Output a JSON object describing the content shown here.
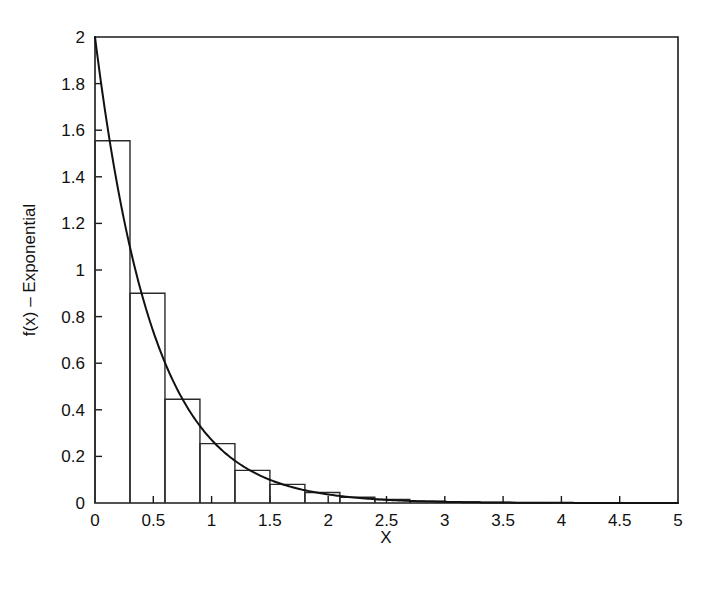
{
  "chart_data": {
    "type": "bar",
    "title": "",
    "xlabel": "X",
    "ylabel": "f(x) – Exponential",
    "xlim": [
      0,
      5
    ],
    "ylim": [
      0,
      2
    ],
    "grid": false,
    "legend": null,
    "x_ticks": [
      "0",
      "0.5",
      "1",
      "1.5",
      "2",
      "2.5",
      "3",
      "3.5",
      "4",
      "4.5",
      "5"
    ],
    "x_tick_values": [
      0,
      0.5,
      1,
      1.5,
      2,
      2.5,
      3,
      3.5,
      4,
      4.5,
      5
    ],
    "y_ticks": [
      "0",
      "0.2",
      "0.4",
      "0.6",
      "0.8",
      "1",
      "1.2",
      "1.4",
      "1.6",
      "1.8",
      "2"
    ],
    "y_tick_values": [
      0,
      0.2,
      0.4,
      0.6,
      0.8,
      1.0,
      1.2,
      1.4,
      1.6,
      1.8,
      2.0
    ],
    "bin_width": 0.3,
    "bin_edges": [
      0,
      0.3,
      0.6,
      0.9,
      1.2,
      1.5,
      1.8,
      2.1,
      2.4,
      2.7,
      3.0,
      3.3,
      3.6,
      3.9,
      4.2,
      4.5,
      4.8
    ],
    "categories": [
      "0-0.3",
      "0.3-0.6",
      "0.6-0.9",
      "0.9-1.2",
      "1.2-1.5",
      "1.5-1.8",
      "1.8-2.1",
      "2.1-2.4",
      "2.4-2.7",
      "2.7-3.0",
      "3.0-3.3",
      "3.3-3.6",
      "3.6-3.9",
      "3.9-4.2",
      "4.2-4.5",
      "4.5-4.8"
    ],
    "values": [
      1.555,
      0.9,
      0.445,
      0.255,
      0.14,
      0.08,
      0.045,
      0.025,
      0.015,
      0.008,
      0.004,
      0.002,
      0.001,
      0.0,
      0.0,
      0.0
    ],
    "series": [
      {
        "name": "Histogram (empirical density)",
        "type": "bar",
        "values": [
          1.555,
          0.9,
          0.445,
          0.255,
          0.14,
          0.08,
          0.045,
          0.025,
          0.015,
          0.008,
          0.004,
          0.002,
          0.001,
          0.0,
          0.0,
          0.0
        ]
      },
      {
        "name": "Exponential PDF (rate = 2)",
        "type": "line",
        "rate": 2,
        "x": [
          0,
          0.1,
          0.2,
          0.3,
          0.4,
          0.5,
          0.6,
          0.7,
          0.8,
          0.9,
          1.0,
          1.2,
          1.4,
          1.6,
          1.8,
          2.0,
          2.25,
          2.5,
          2.75,
          3.0,
          3.5,
          4.0,
          4.5,
          5.0
        ],
        "values": [
          2.0,
          1.637,
          1.341,
          1.098,
          0.899,
          0.736,
          0.602,
          0.493,
          0.404,
          0.331,
          0.271,
          0.181,
          0.122,
          0.0815,
          0.0546,
          0.0366,
          0.0222,
          0.0135,
          0.00818,
          0.00496,
          0.00182,
          0.00067,
          0.000247,
          9.08e-05
        ]
      }
    ]
  },
  "axis": {
    "x_title": "X",
    "y_title": "f(x) – Exponential"
  }
}
